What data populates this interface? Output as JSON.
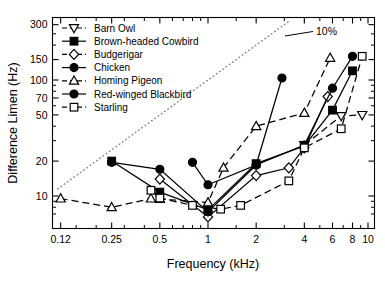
{
  "chart_data": {
    "type": "line",
    "title": "",
    "xlabel": "Frequency (kHz)",
    "ylabel": "Difference Limen (Hz)",
    "xscale": "log",
    "yscale": "log",
    "xlim": [
      0.1,
      11
    ],
    "ylim": [
      6,
      330
    ],
    "xticks": [
      0.12,
      0.25,
      0.5,
      1,
      2,
      4,
      6,
      8,
      10
    ],
    "xtick_labels": [
      "0.12",
      "0.25",
      "0.5",
      "1",
      "2",
      "4",
      "6",
      "8",
      "10"
    ],
    "yticks": [
      10,
      20,
      50,
      70,
      100,
      150,
      300
    ],
    "ytick_labels": [
      "10",
      "20",
      "50",
      "70",
      "100",
      "150",
      "300"
    ],
    "grid": false,
    "legend_position": "top-left",
    "annotations": [
      {
        "text": "10%",
        "x": 3.6,
        "y": 230,
        "note": "label for dotted 10% reference line"
      }
    ],
    "reference_line": {
      "name": "10% line",
      "style": "dotted",
      "x": [
        0.115,
        3.2
      ],
      "y": [
        11.5,
        320
      ]
    },
    "series": [
      {
        "name": "Barn Owl",
        "marker": "triangle-down-open",
        "line": "dashed",
        "x": [
          4.0,
          6.8,
          9.2
        ],
        "y": [
          27.5,
          49,
          50
        ]
      },
      {
        "name": "Brown-headed Cowbird",
        "marker": "square-filled",
        "line": "solid",
        "x": [
          0.25,
          0.5,
          1.0,
          2.0,
          4.0,
          6.0,
          8.0
        ],
        "y": [
          20.0,
          10.8,
          7.6,
          19.0,
          27.0,
          55,
          120
        ]
      },
      {
        "name": "Budgerigar",
        "marker": "diamond-open",
        "line": "solid",
        "x": [
          0.5,
          1.0,
          2.0,
          3.2,
          4.0,
          5.6
        ],
        "y": [
          14.0,
          6.6,
          15.0,
          17.5,
          26.0,
          72
        ]
      },
      {
        "name": "Chicken",
        "marker": "circle-filled",
        "line": "solid",
        "x": [
          0.8,
          1.0,
          2.0,
          2.9
        ],
        "y": [
          19.5,
          12.5,
          18.5,
          104
        ]
      },
      {
        "name": "Homing Pigeon",
        "marker": "triangle-up-open",
        "line": "dashed",
        "x": [
          0.12,
          0.25,
          0.44,
          0.5,
          1.0,
          1.25,
          2.0,
          4.0,
          5.8
        ],
        "y": [
          9.5,
          8.0,
          9.5,
          9.4,
          8.8,
          17.5,
          40,
          52,
          155
        ]
      },
      {
        "name": "Red-winged Blackbird",
        "marker": "circle-filled",
        "line": "solid",
        "x": [
          0.25,
          0.5,
          1.0,
          2.0,
          4.0,
          6.0,
          8.0
        ],
        "y": [
          19.5,
          17.0,
          7.3,
          18.5,
          27.5,
          85,
          160
        ]
      },
      {
        "name": "Starling",
        "marker": "square-open",
        "line": "dashed",
        "x": [
          0.44,
          0.5,
          0.8,
          1.2,
          1.6,
          3.2,
          4.0,
          6.8,
          9.2
        ],
        "y": [
          11.2,
          9.6,
          8.3,
          7.7,
          8.3,
          13.5,
          26.0,
          38,
          160
        ]
      }
    ]
  },
  "legend": {
    "items": [
      {
        "label": "Barn Owl",
        "marker": "triangle-down-open",
        "line": "dashed"
      },
      {
        "label": "Brown-headed Cowbird",
        "marker": "square-filled",
        "line": "solid"
      },
      {
        "label": "Budgerigar",
        "marker": "diamond-open",
        "line": "dashed"
      },
      {
        "label": "Chicken",
        "marker": "circle-filled",
        "line": "solid"
      },
      {
        "label": "Homing Pigeon",
        "marker": "triangle-up-open",
        "line": "dashed"
      },
      {
        "label": "Red-winged Blackbird",
        "marker": "circle-filled",
        "line": "solid"
      },
      {
        "label": "Starling",
        "marker": "square-open",
        "line": "dashed"
      }
    ]
  },
  "colors": {
    "foreground": "#000000",
    "background": "#ffffff",
    "reference_line": "#808080"
  }
}
